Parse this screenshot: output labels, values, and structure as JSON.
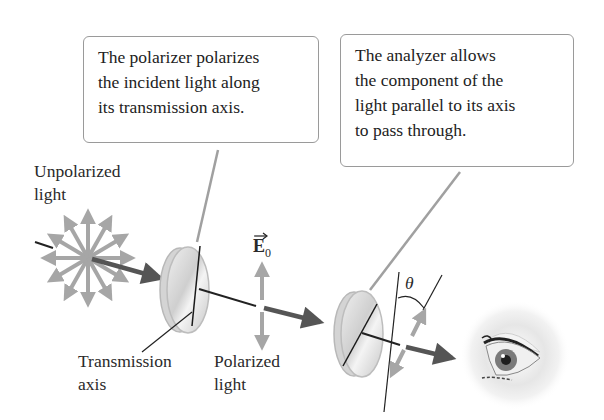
{
  "callouts": {
    "polarizer": {
      "lines": [
        "The polarizer polarizes",
        "the incident light along",
        "its transmission axis."
      ]
    },
    "analyzer": {
      "lines": [
        "The analyzer allows",
        "the component of the",
        "light parallel to its axis",
        "to pass through."
      ]
    }
  },
  "labels": {
    "unpolarized": [
      "Unpolarized",
      "light"
    ],
    "transmission_axis": [
      "Transmission",
      "axis"
    ],
    "polarized": [
      "Polarized",
      "light"
    ],
    "e_field": "E",
    "e_field_subscript": "0",
    "angle": "θ"
  },
  "colors": {
    "beam": "#555555",
    "field_arrows": "#a6a6a6",
    "callout_border": "#9a9a9a",
    "leader_line": "#a0a0a0",
    "disk_fill": "#dcdcdc",
    "axis_line": "#1a1a1a"
  },
  "icons": {
    "eye": "eye-icon",
    "polarizer": "polarizer-disk-icon",
    "analyzer": "analyzer-disk-icon",
    "unpolarized_star": "unpolarized-light-star-icon"
  }
}
